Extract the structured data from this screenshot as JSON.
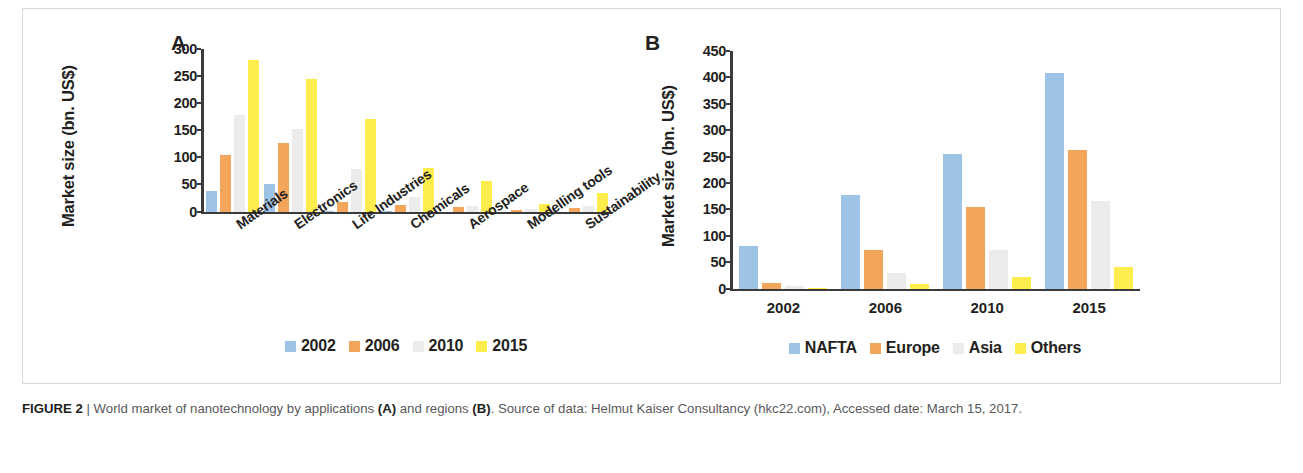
{
  "figure": {
    "caption_label": "FIGURE 2",
    "caption_separator": " | ",
    "caption_part1": "World market of nanotechnology by applications ",
    "caption_a": "(A)",
    "caption_part2": " and regions ",
    "caption_b": "(B)",
    "caption_part3": ". Source of data: Helmut Kaiser Consultancy (hkc22.com), Accessed date: March 15, 2017."
  },
  "colors": {
    "series0": "#9dc3e6",
    "series1": "#f4a55c",
    "series2": "#ececec",
    "series3": "#ffed4e",
    "axis": "#3b3b3b",
    "text": "#231f20",
    "caption": "#58595b"
  },
  "panel_a": {
    "letter": "A",
    "ylabel": "Market size (bn. US$)"
  },
  "panel_b": {
    "letter": "B",
    "ylabel": "Market size (bn. US$)"
  },
  "chart_data": [
    {
      "panel": "A",
      "type": "bar",
      "title": "World market of nanotechnology by applications",
      "xlabel": "",
      "ylabel": "Market size (bn. US$)",
      "ylim": [
        0,
        300
      ],
      "yticks": [
        0,
        50,
        100,
        150,
        200,
        250,
        300
      ],
      "grid": false,
      "legend_position": "bottom",
      "categories": [
        "Materials",
        "Electronics",
        "Life Industries",
        "Chemicals",
        "Aerospace",
        "Modelling tools",
        "Sustainability"
      ],
      "series": [
        {
          "name": "2002",
          "color": "#9dc3e6",
          "values": [
            38,
            50,
            1,
            1,
            0,
            0,
            0
          ]
        },
        {
          "name": "2006",
          "color": "#f4a55c",
          "values": [
            105,
            126,
            17,
            12,
            9,
            3,
            7
          ]
        },
        {
          "name": "2010",
          "color": "#ececec",
          "values": [
            178,
            152,
            78,
            26,
            10,
            5,
            10
          ]
        },
        {
          "name": "2015",
          "color": "#ffed4e",
          "values": [
            280,
            245,
            171,
            80,
            57,
            13,
            35
          ]
        }
      ]
    },
    {
      "panel": "B",
      "type": "bar",
      "title": "World market of nanotechnology by regions",
      "xlabel": "",
      "ylabel": "Market size (bn. US$)",
      "ylim": [
        0,
        450
      ],
      "yticks": [
        0,
        50,
        100,
        150,
        200,
        250,
        300,
        350,
        400,
        450
      ],
      "grid": false,
      "legend_position": "bottom",
      "categories": [
        "2002",
        "2006",
        "2010",
        "2015"
      ],
      "series": [
        {
          "name": "NAFTA",
          "color": "#9dc3e6",
          "values": [
            80,
            178,
            255,
            408
          ]
        },
        {
          "name": "Europe",
          "color": "#f4a55c",
          "values": [
            10,
            73,
            155,
            262
          ]
        },
        {
          "name": "Asia",
          "color": "#ececec",
          "values": [
            5,
            29,
            73,
            165
          ]
        },
        {
          "name": "Others",
          "color": "#ffed4e",
          "values": [
            1,
            9,
            22,
            41
          ]
        }
      ]
    }
  ]
}
